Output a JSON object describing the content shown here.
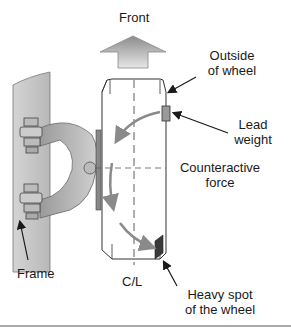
{
  "labels": {
    "front": "Front",
    "outside_line1": "Outside",
    "outside_line2": "of wheel",
    "lead_line1": "Lead",
    "lead_line2": "weight",
    "counter_line1": "Counteractive",
    "counter_line2": "force",
    "frame": "Frame",
    "centerline": "C/L",
    "heavy_line1": "Heavy spot",
    "heavy_line2": "of the wheel"
  },
  "colors": {
    "frame_fill": "#c8c8c8",
    "arrow_gray": "#8a8a8a",
    "lead_weight": "#9a9a9a",
    "heavy_spot": "#3a3a3a",
    "outline": "#333333"
  }
}
